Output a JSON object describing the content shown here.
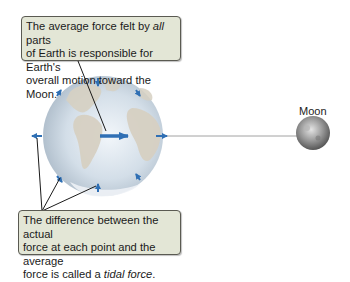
{
  "callouts": {
    "top": {
      "line1_pre": "The average force felt by ",
      "line1_italic": "all",
      "line1_post": " parts",
      "line2": "of Earth is responsible for Earth's",
      "line3": "overall motion toward the Moon."
    },
    "bottom": {
      "line1": "The difference between the actual",
      "line2": "force at each point and the average",
      "line3_pre": "force is called a ",
      "line3_italic": "tidal force",
      "line3_post": "."
    }
  },
  "labels": {
    "moon": "Moon"
  },
  "colors": {
    "callout_bg": "#e3e6d6",
    "arrow_blue": "#2f6fb4",
    "earth_ocean": "#c9d6e2",
    "earth_land": "#d8d2c4",
    "moon_gray": "#8a8a8a"
  }
}
